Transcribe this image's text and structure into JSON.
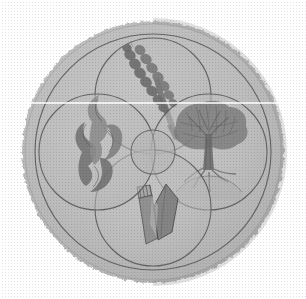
{
  "image": {
    "kind": "illustration",
    "subject": "circular four-lobed emblem",
    "medium": "halftone line engraving",
    "width": 306,
    "height": 299,
    "background_color": "#ffffff"
  },
  "palette": {
    "background": "#ffffff",
    "disc_fill": "#b9b9b9",
    "disc_fill_light": "#c6c6c6",
    "lobe_fill": "#bdbdbd",
    "center_fill": "#b4b4b4",
    "line": "#4a4a4a",
    "line_soft": "#6d6d6d",
    "motif_dark": "#6b6b6b",
    "motif_mid": "#8a8a8a",
    "motif_light": "#9e9e9e",
    "edge_shadow": "#a3a3a3"
  },
  "geometry": {
    "disc_center_x": 153,
    "disc_center_y": 152,
    "disc_radius": 131,
    "inner_ring_radius": 118,
    "lobe_radius": 58,
    "lobe_offset": 56,
    "center_circle_radius": 22
  },
  "emblem": {
    "name": "four-lobed roundel",
    "lobe_count": 4,
    "lobes": [
      {
        "position": "top",
        "motif": "wheat-ear",
        "motif_label": "ear of wheat on stalk",
        "center_x": 153,
        "center_y": 96
      },
      {
        "position": "right",
        "motif": "tree",
        "motif_label": "broad-canopy tree with exposed roots",
        "center_x": 209,
        "center_y": 152
      },
      {
        "position": "bottom",
        "motif": "scroll-and-blade",
        "motif_label": "ruled tablet and pointed blade",
        "center_x": 153,
        "center_y": 208
      },
      {
        "position": "left",
        "motif": "flame",
        "motif_label": "curling flame or smoke wisp",
        "center_x": 97,
        "center_y": 152
      }
    ],
    "center": {
      "motif": "plain-roundel",
      "motif_label": "small empty central circle"
    }
  }
}
